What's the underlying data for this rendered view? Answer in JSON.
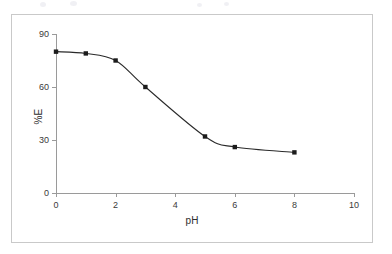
{
  "chart_data": {
    "type": "line",
    "title": "",
    "xlabel": "pH",
    "ylabel": "%E",
    "xlim": [
      0,
      10
    ],
    "ylim": [
      0,
      90
    ],
    "xticks": [
      0,
      2,
      4,
      6,
      8,
      10
    ],
    "yticks": [
      0,
      30,
      60,
      90
    ],
    "xtick_labels": [
      "0",
      "2",
      "4",
      "6",
      "8",
      "10"
    ],
    "ytick_labels": [
      "0",
      "30",
      "60",
      "90"
    ],
    "grid": false,
    "legend": false,
    "series": [
      {
        "name": "%E vs pH",
        "marker": "square",
        "color": "#1c1c1c",
        "x": [
          0,
          1,
          2,
          3,
          5,
          6,
          8
        ],
        "y": [
          80,
          79,
          75,
          60,
          32,
          26,
          23
        ]
      }
    ]
  },
  "figure": {
    "border_color": "#c9c9c9",
    "axis_color": "#9a9a9a",
    "line_color": "#2a2a2a",
    "marker_color": "#1c1c1c",
    "background": "#ffffff"
  }
}
